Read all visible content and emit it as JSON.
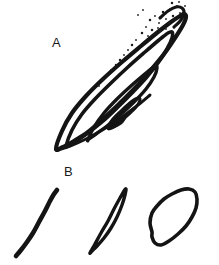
{
  "figure": {
    "background_color": "#ffffff",
    "ink_color": "#141414",
    "width": 219,
    "height": 265,
    "panels": [
      {
        "id": "A",
        "label": "A",
        "label_position": {
          "x": 52,
          "y": 36
        },
        "description": "nested spiral lens-shaped outlines with stippled upper tip",
        "curves": [
          {
            "name": "outer-lens",
            "closed": true,
            "stroke_width": 4.2,
            "points": [
              [
                56,
                149
              ],
              [
                62,
                131
              ],
              [
                72,
                113
              ],
              [
                86,
                96
              ],
              [
                103,
                79
              ],
              [
                122,
                62
              ],
              [
                141,
                46
              ],
              [
                158,
                32
              ],
              [
                171,
                22
              ],
              [
                180,
                16
              ],
              [
                184,
                14
              ],
              [
                186,
                17
              ],
              [
                183,
                25
              ],
              [
                175,
                38
              ],
              [
                164,
                54
              ],
              [
                150,
                71
              ],
              [
                135,
                88
              ],
              [
                119,
                104
              ],
              [
                103,
                119
              ],
              [
                88,
                132
              ],
              [
                74,
                141
              ],
              [
                63,
                147
              ],
              [
                56,
                149
              ]
            ]
          },
          {
            "name": "second-lens",
            "closed": true,
            "stroke_width": 3.6,
            "points": [
              [
                66,
                146
              ],
              [
                72,
                130
              ],
              [
                82,
                114
              ],
              [
                95,
                99
              ],
              [
                111,
                83
              ],
              [
                128,
                67
              ],
              [
                145,
                52
              ],
              [
                159,
                40
              ],
              [
                168,
                33
              ],
              [
                172,
                32
              ],
              [
                172,
                38
              ],
              [
                167,
                49
              ],
              [
                158,
                63
              ],
              [
                146,
                78
              ],
              [
                132,
                93
              ],
              [
                117,
                108
              ],
              [
                102,
                122
              ],
              [
                88,
                133
              ],
              [
                76,
                141
              ],
              [
                68,
                146
              ],
              [
                66,
                146
              ]
            ]
          },
          {
            "name": "third-lens",
            "closed": true,
            "stroke_width": 3.4,
            "points": [
              [
                88,
                140
              ],
              [
                94,
                127
              ],
              [
                104,
                113
              ],
              [
                117,
                99
              ],
              [
                132,
                85
              ],
              [
                146,
                73
              ],
              [
                155,
                66
              ],
              [
                157,
                68
              ],
              [
                154,
                77
              ],
              [
                146,
                89
              ],
              [
                134,
                102
              ],
              [
                120,
                115
              ],
              [
                107,
                126
              ],
              [
                96,
                134
              ],
              [
                89,
                139
              ],
              [
                88,
                140
              ]
            ]
          },
          {
            "name": "inner-loop",
            "closed": true,
            "stroke_width": 3.0,
            "points": [
              [
                108,
                128
              ],
              [
                113,
                119
              ],
              [
                122,
                110
              ],
              [
                131,
                102
              ],
              [
                138,
                98
              ],
              [
                140,
                100
              ],
              [
                136,
                107
              ],
              [
                128,
                115
              ],
              [
                119,
                123
              ],
              [
                112,
                128
              ],
              [
                108,
                128
              ]
            ]
          },
          {
            "name": "inner-blob",
            "closed": true,
            "filled": true,
            "points": [
              [
                109,
                127
              ],
              [
                115,
                120
              ],
              [
                122,
                116
              ],
              [
                126,
                118
              ],
              [
                122,
                124
              ],
              [
                114,
                128
              ],
              [
                109,
                127
              ]
            ]
          },
          {
            "name": "apex-hook",
            "closed": false,
            "stroke_width": 3.2,
            "points": [
              [
                160,
                18
              ],
              [
                168,
                11
              ],
              [
                176,
                7
              ],
              [
                182,
                8
              ],
              [
                184,
                13
              ],
              [
                181,
                20
              ],
              [
                174,
                27
              ]
            ]
          },
          {
            "name": "lower-tail",
            "closed": false,
            "stroke_width": 3.0,
            "points": [
              [
                57,
                150
              ],
              [
                70,
                146
              ],
              [
                86,
                139
              ],
              [
                104,
                129
              ],
              [
                122,
                117
              ],
              [
                138,
                105
              ],
              [
                150,
                95
              ]
            ]
          }
        ],
        "stipple_points": [
          [
            150,
            20
          ],
          [
            155,
            16
          ],
          [
            159,
            23
          ],
          [
            163,
            12
          ],
          [
            166,
            19
          ],
          [
            170,
            9
          ],
          [
            173,
            16
          ],
          [
            177,
            6
          ],
          [
            146,
            27
          ],
          [
            152,
            30
          ],
          [
            158,
            28
          ],
          [
            164,
            26
          ],
          [
            169,
            23
          ],
          [
            175,
            20
          ],
          [
            180,
            13
          ],
          [
            142,
            33
          ],
          [
            148,
            36
          ],
          [
            154,
            34
          ],
          [
            160,
            31
          ],
          [
            166,
            29
          ],
          [
            136,
            40
          ],
          [
            132,
            45
          ],
          [
            128,
            50
          ],
          [
            124,
            55
          ],
          [
            120,
            60
          ],
          [
            143,
            10
          ],
          [
            138,
            15
          ],
          [
            172,
            3
          ],
          [
            179,
            2
          ],
          [
            185,
            6
          ],
          [
            116,
            65
          ],
          [
            111,
            70
          ],
          [
            107,
            75
          ],
          [
            103,
            80
          ],
          [
            99,
            86
          ]
        ]
      },
      {
        "id": "B",
        "label": "B",
        "label_position": {
          "x": 64,
          "y": 165
        },
        "description": "three separate profile curves: open arc, narrow lens, tilted ellipse",
        "curves": [
          {
            "name": "b-curve-arc",
            "closed": false,
            "stroke_width": 4.6,
            "points": [
              [
                16,
                256
              ],
              [
                21,
                250
              ],
              [
                27,
                242
              ],
              [
                33,
                233
              ],
              [
                39,
                222
              ],
              [
                45,
                211
              ],
              [
                50,
                201
              ],
              [
                54,
                194
              ],
              [
                57,
                190
              ]
            ]
          },
          {
            "name": "b-curve-lens",
            "closed": true,
            "stroke_width": 3.4,
            "points": [
              [
                90,
                253
              ],
              [
                95,
                244
              ],
              [
                101,
                233
              ],
              [
                108,
                221
              ],
              [
                114,
                209
              ],
              [
                120,
                198
              ],
              [
                124,
                191
              ],
              [
                126,
                189
              ],
              [
                125,
                195
              ],
              [
                122,
                205
              ],
              [
                117,
                217
              ],
              [
                111,
                228
              ],
              [
                104,
                238
              ],
              [
                97,
                246
              ],
              [
                92,
                251
              ],
              [
                90,
                253
              ]
            ]
          },
          {
            "name": "b-curve-ellipse",
            "closed": true,
            "stroke_width": 3.6,
            "points": [
              [
                152,
                232
              ],
              [
                150,
                223
              ],
              [
                152,
                213
              ],
              [
                157,
                206
              ],
              [
                164,
                199
              ],
              [
                172,
                194
              ],
              [
                181,
                190
              ],
              [
                189,
                189
              ],
              [
                195,
                192
              ],
              [
                197,
                199
              ],
              [
                196,
                208
              ],
              [
                192,
                217
              ],
              [
                186,
                226
              ],
              [
                178,
                234
              ],
              [
                169,
                241
              ],
              [
                161,
                245
              ],
              [
                155,
                243
              ],
              [
                152,
                237
              ],
              [
                152,
                232
              ]
            ]
          }
        ]
      }
    ]
  }
}
